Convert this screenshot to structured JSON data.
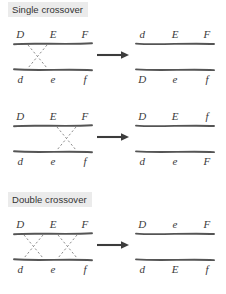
{
  "diagram": {
    "title_single": "Single crossover",
    "title_double": "Double crossover",
    "ink_color": "#555555",
    "text_color": "#3a3a3a",
    "header_bg": "#ebebeb",
    "arrow_label": "yields"
  },
  "panels": [
    {
      "id": "single-crossover-1",
      "section": "single",
      "before": {
        "top_alleles": [
          "D",
          "E",
          "F"
        ],
        "bottom_alleles": [
          "d",
          "e",
          "f"
        ],
        "crossovers": [
          {
            "between": "D-E",
            "x_center_pct": 30
          }
        ]
      },
      "after": {
        "top_alleles": [
          "d",
          "E",
          "F"
        ],
        "bottom_alleles": [
          "D",
          "e",
          "f"
        ]
      }
    },
    {
      "id": "single-crossover-2",
      "section": "single",
      "before": {
        "top_alleles": [
          "D",
          "E",
          "F"
        ],
        "bottom_alleles": [
          "d",
          "e",
          "f"
        ],
        "crossovers": [
          {
            "between": "E-F",
            "x_center_pct": 70
          }
        ]
      },
      "after": {
        "top_alleles": [
          "D",
          "E",
          "f"
        ],
        "bottom_alleles": [
          "d",
          "e",
          "F"
        ]
      }
    },
    {
      "id": "double-crossover-1",
      "section": "double",
      "before": {
        "top_alleles": [
          "D",
          "E",
          "F"
        ],
        "bottom_alleles": [
          "d",
          "e",
          "f"
        ],
        "crossovers": [
          {
            "between": "D-E",
            "x_center_pct": 30
          },
          {
            "between": "E-F",
            "x_center_pct": 70
          }
        ]
      },
      "after": {
        "top_alleles": [
          "D",
          "e",
          "F"
        ],
        "bottom_alleles": [
          "d",
          "E",
          "f"
        ]
      }
    }
  ]
}
